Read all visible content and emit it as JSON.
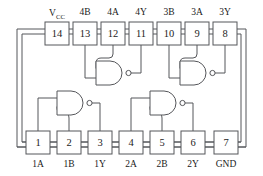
{
  "diagram": {
    "package": "14-pin DIP",
    "colors": {
      "line": "#55565a",
      "text": "#1b1b1b",
      "background": "#ffffff"
    },
    "top_pins": [
      {
        "number": "14",
        "label": "V",
        "sublabel": "CC",
        "x": 57,
        "label_x": 57
      },
      {
        "number": "13",
        "label": "4B",
        "sublabel": "",
        "x": 85,
        "label_x": 85
      },
      {
        "number": "12",
        "label": "4A",
        "sublabel": "",
        "x": 113,
        "label_x": 113
      },
      {
        "number": "11",
        "label": "4Y",
        "sublabel": "",
        "x": 141,
        "label_x": 141
      },
      {
        "number": "10",
        "label": "3B",
        "sublabel": "",
        "x": 169,
        "label_x": 169
      },
      {
        "number": "9",
        "label": "3A",
        "sublabel": "",
        "x": 197,
        "label_x": 197
      },
      {
        "number": "8",
        "label": "3Y",
        "sublabel": "",
        "x": 225,
        "label_x": 225
      }
    ],
    "bottom_pins": [
      {
        "number": "1",
        "label": "1A",
        "x": 38,
        "label_x": 38
      },
      {
        "number": "2",
        "label": "1B",
        "x": 69,
        "label_x": 69
      },
      {
        "number": "3",
        "label": "1Y",
        "x": 100,
        "label_x": 100
      },
      {
        "number": "4",
        "label": "2A",
        "x": 131,
        "label_x": 131
      },
      {
        "number": "5",
        "label": "2B",
        "x": 162,
        "label_x": 162
      },
      {
        "number": "6",
        "label": "2Y",
        "x": 193,
        "label_x": 193
      },
      {
        "number": "7",
        "label": "GND",
        "x": 226,
        "label_x": 226
      }
    ],
    "gates": [
      {
        "id": "gate-1",
        "name": "NAND gate 1",
        "inputs": [
          "1A",
          "1B"
        ],
        "output": "1Y"
      },
      {
        "id": "gate-2",
        "name": "NAND gate 2",
        "inputs": [
          "2A",
          "2B"
        ],
        "output": "2Y"
      },
      {
        "id": "gate-3",
        "name": "NAND gate 3",
        "inputs": [
          "3A",
          "3B"
        ],
        "output": "3Y"
      },
      {
        "id": "gate-4",
        "name": "NAND gate 4",
        "inputs": [
          "4A",
          "4B"
        ],
        "output": "4Y"
      }
    ]
  }
}
